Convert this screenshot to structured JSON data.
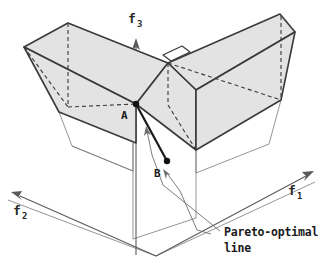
{
  "figure": {
    "type": "3d-objective-space-diagram",
    "background_color": "#ffffff",
    "surface_fill_color": "#e3e3e3",
    "stroke_color": "#3a3a3a",
    "thin_stroke_color": "#6e6e6e",
    "point_color": "#111111",
    "axes": [
      {
        "id": "f1",
        "base": "f",
        "subscript": "1",
        "label": "f",
        "sub": "1",
        "direction": "upper-right"
      },
      {
        "id": "f2",
        "base": "f",
        "subscript": "2",
        "label": "f",
        "sub": "2",
        "direction": "lower-left"
      },
      {
        "id": "f3",
        "base": "f",
        "subscript": "3",
        "label": "f",
        "sub": "3",
        "direction": "up"
      }
    ],
    "points": [
      {
        "id": "A",
        "label": "A",
        "x": 135,
        "y": 104
      },
      {
        "id": "B",
        "label": "B",
        "x": 166,
        "y": 162
      }
    ],
    "annotations": [
      {
        "id": "pareto-callout",
        "line1": "Pareto-optimal",
        "line2": "line"
      }
    ]
  }
}
